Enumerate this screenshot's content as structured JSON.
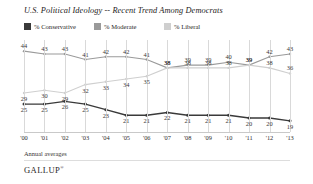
{
  "chart_data": {
    "type": "line",
    "title": "U.S. Political Ideology -- Recent Trend Among Democrats",
    "xlabel": "",
    "ylabel": "",
    "categories": [
      "'00",
      "'01",
      "'02",
      "'03",
      "'04",
      "'05",
      "'06",
      "'07",
      "'08",
      "'09",
      "'10",
      "'11",
      "'12",
      "'13"
    ],
    "ylim": [
      15,
      48
    ],
    "grid": false,
    "legend_position": "top-left",
    "note": "Annual averages",
    "brand": "GALLUP",
    "brand_mark": "®",
    "series": [
      {
        "name": "% Conservative",
        "color": "#3a3a3a",
        "values": [
          25,
          25,
          26,
          25,
          23,
          21,
          21,
          22,
          21,
          21,
          21,
          20,
          20,
          19
        ]
      },
      {
        "name": "% Moderate",
        "color": "#9a9a9a",
        "values": [
          44,
          43,
          43,
          41,
          42,
          42,
          41,
          38,
          39,
          39,
          40,
          39,
          42,
          43
        ]
      },
      {
        "name": "% Liberal",
        "color": "#cfcfcf",
        "values": [
          29,
          30,
          29,
          32,
          33,
          34,
          35,
          38,
          38,
          38,
          38,
          39,
          38,
          36
        ]
      }
    ]
  }
}
